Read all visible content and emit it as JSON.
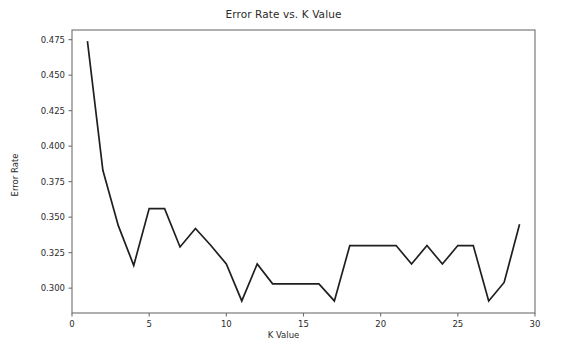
{
  "chart_data": {
    "type": "line",
    "title": "Error Rate vs. K Value",
    "xlabel": "K Value",
    "ylabel": "Error Rate",
    "x": [
      1,
      2,
      3,
      4,
      5,
      6,
      7,
      8,
      9,
      10,
      11,
      12,
      13,
      14,
      15,
      16,
      17,
      18,
      19,
      20,
      21,
      22,
      23,
      24,
      25,
      26,
      27,
      28,
      29
    ],
    "values": [
      0.474,
      0.383,
      0.344,
      0.316,
      0.356,
      0.356,
      0.329,
      0.342,
      0.33,
      0.317,
      0.291,
      0.317,
      0.303,
      0.303,
      0.303,
      0.303,
      0.291,
      0.33,
      0.33,
      0.33,
      0.33,
      0.317,
      0.33,
      0.317,
      0.33,
      0.33,
      0.291,
      0.304,
      0.345
    ],
    "series": [
      {
        "name": "Error Rate",
        "values": [
          0.474,
          0.383,
          0.344,
          0.316,
          0.356,
          0.356,
          0.329,
          0.342,
          0.33,
          0.317,
          0.291,
          0.317,
          0.303,
          0.303,
          0.303,
          0.303,
          0.291,
          0.33,
          0.33,
          0.33,
          0.33,
          0.317,
          0.33,
          0.317,
          0.33,
          0.33,
          0.291,
          0.304,
          0.345
        ],
        "color": "#1f1f1f"
      }
    ],
    "xlim": [
      0,
      30
    ],
    "ylim": [
      0.2825,
      0.4818
    ],
    "xticks": [
      0,
      5,
      10,
      15,
      20,
      25,
      30
    ],
    "xticklabels": [
      "0",
      "5",
      "10",
      "15",
      "20",
      "25",
      "30"
    ],
    "yticks": [
      0.3,
      0.325,
      0.35,
      0.375,
      0.4,
      0.425,
      0.45,
      0.475
    ],
    "yticklabels": [
      "0.300",
      "0.325",
      "0.350",
      "0.375",
      "0.400",
      "0.425",
      "0.450",
      "0.475"
    ],
    "grid": false,
    "legend": null,
    "line_color": "#1f1f1f",
    "background_color": "#ffffff",
    "axis_color": "#6e6e6e"
  }
}
